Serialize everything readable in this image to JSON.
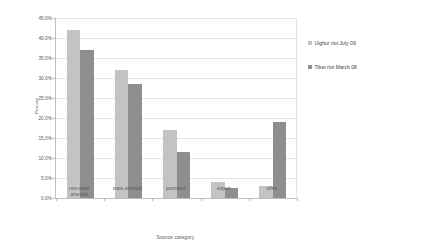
{
  "chart_data": {
    "type": "bar",
    "title": "",
    "xlabel": "Source category",
    "ylabel": "Percent",
    "categories": [
      "non-state oriented",
      "state oriented",
      "journalist",
      "expert",
      "other"
    ],
    "category_labels": [
      "non-state\noriented",
      "state oriented",
      "journalist",
      "expert",
      "other"
    ],
    "series": [
      {
        "name": "Uighur riot July 09",
        "color": "#c3c3c3",
        "values": [
          42.0,
          32.0,
          17.0,
          4.0,
          3.0
        ]
      },
      {
        "name": "Tibet riot March 08",
        "color": "#8e8e8e",
        "values": [
          37.0,
          28.5,
          11.5,
          2.5,
          19.0
        ]
      }
    ],
    "ylim": [
      0,
      45
    ],
    "ytick_step": 5,
    "ytick_labels": [
      "0,0%",
      "5,0%",
      "10,0%",
      "15,0%",
      "20,0%",
      "25,0%",
      "30,0%",
      "35,0%",
      "40,0%",
      "45,0%"
    ],
    "ytick_values": [
      0,
      5,
      10,
      15,
      20,
      25,
      30,
      35,
      40,
      45
    ],
    "grid": true,
    "legend_position": "right"
  },
  "legend": {
    "entries": [
      {
        "label": "Uighur riot July 09",
        "marker": "square-swatch-light"
      },
      {
        "label": "Tibet riot March 08",
        "marker": "square-swatch-dark"
      }
    ]
  },
  "colors": {
    "series_light": "#c3c3c3",
    "series_dark": "#8e8e8e",
    "gridline": "#e3e3e3",
    "axis": "#bfbfbf",
    "text": "#59595c",
    "background": "#ffffff"
  }
}
